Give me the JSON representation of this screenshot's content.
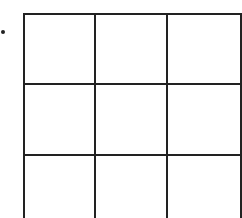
{
  "diagram": {
    "type": "grid",
    "rows_visible": 3,
    "columns": 3,
    "line_color": "#222222",
    "background": "#ffffff",
    "bullet_marker": "•",
    "cells": [
      [
        "",
        "",
        ""
      ],
      [
        "",
        "",
        ""
      ],
      [
        "",
        "",
        ""
      ]
    ]
  }
}
